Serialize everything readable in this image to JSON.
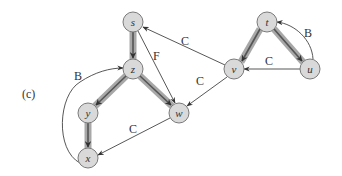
{
  "figure": {
    "panel_label": "(c)",
    "colors": {
      "node_fill": "#d9d9d9",
      "node_stroke": "#7a7a7a",
      "tree_edge_outer": "#9a9a9a",
      "tree_edge_inner": "#5a5a5a",
      "thin_edge": "#444444",
      "text": "#333333"
    }
  },
  "nodes": [
    {
      "id": "s",
      "label": "s",
      "x": 133,
      "y": 22
    },
    {
      "id": "z",
      "label": "z",
      "x": 133,
      "y": 69
    },
    {
      "id": "y",
      "label": "y",
      "x": 88,
      "y": 113
    },
    {
      "id": "x",
      "label": "x",
      "x": 88,
      "y": 158
    },
    {
      "id": "w",
      "label": "w",
      "x": 179,
      "y": 113
    },
    {
      "id": "t",
      "label": "t",
      "x": 267,
      "y": 22
    },
    {
      "id": "v",
      "label": "v",
      "x": 234,
      "y": 69
    },
    {
      "id": "u",
      "label": "u",
      "x": 310,
      "y": 69
    }
  ],
  "edges": [
    {
      "from": "s",
      "to": "z",
      "type": "tree",
      "label": ""
    },
    {
      "from": "z",
      "to": "y",
      "type": "tree",
      "label": ""
    },
    {
      "from": "z",
      "to": "w",
      "type": "tree",
      "label": ""
    },
    {
      "from": "y",
      "to": "x",
      "type": "tree",
      "label": ""
    },
    {
      "from": "t",
      "to": "v",
      "type": "tree",
      "label": ""
    },
    {
      "from": "t",
      "to": "u",
      "type": "tree",
      "label": ""
    },
    {
      "from": "s",
      "to": "w",
      "type": "forward",
      "label": "F"
    },
    {
      "from": "v",
      "to": "s",
      "type": "cross",
      "label": "C"
    },
    {
      "from": "v",
      "to": "w",
      "type": "cross",
      "label": "C"
    },
    {
      "from": "u",
      "to": "v",
      "type": "cross",
      "label": "C"
    },
    {
      "from": "w",
      "to": "x",
      "type": "cross",
      "label": "C"
    },
    {
      "from": "x",
      "to": "z",
      "type": "back",
      "label": "B"
    },
    {
      "from": "u",
      "to": "t",
      "type": "back",
      "label": "B"
    }
  ]
}
